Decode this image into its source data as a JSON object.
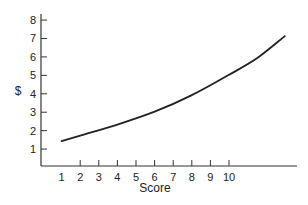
{
  "chart_data": {
    "type": "line",
    "title": "",
    "xlabel": "Score",
    "ylabel": "$",
    "xlim": [
      0,
      14
    ],
    "ylim": [
      0,
      8.3
    ],
    "x_ticks": [
      1,
      2,
      3,
      4,
      5,
      6,
      7,
      8,
      9,
      10
    ],
    "y_ticks": [
      1,
      2,
      3,
      4,
      5,
      6,
      7,
      8
    ],
    "grid": false,
    "legend": null,
    "series": [
      {
        "name": "curve",
        "x": [
          1,
          2,
          4,
          6,
          8,
          10,
          11.5,
          13
        ],
        "values": [
          1.4,
          1.7,
          2.3,
          3.0,
          3.9,
          5.0,
          5.9,
          7.1
        ]
      }
    ]
  },
  "colors": {
    "line": "#222222",
    "axis": "#333333",
    "background": "#ffffff"
  }
}
